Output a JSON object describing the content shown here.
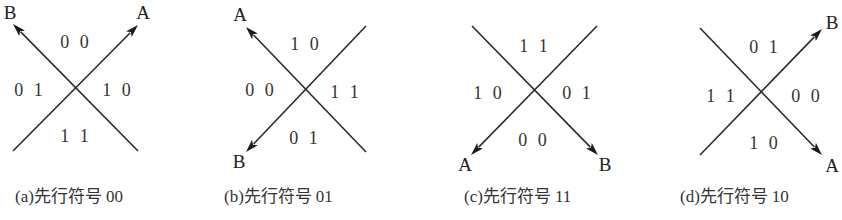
{
  "figure": {
    "panels": [
      {
        "id": "a",
        "caption": {
          "letter": "a",
          "text": "先行符号",
          "code": "00",
          "x": 15
        },
        "center": [
          75,
          88
        ],
        "lines": [
          {
            "from": [
              13,
              151
            ],
            "to": [
              138,
              25
            ],
            "arrow": "to",
            "endpoint_label": "A",
            "label_pos": [
              143,
              12
            ]
          },
          {
            "from": [
              138,
              151
            ],
            "to": [
              13,
              24
            ],
            "arrow": "to",
            "endpoint_label": "B",
            "label_pos": [
              10,
              12
            ]
          }
        ],
        "regions": {
          "top": "00",
          "left": "01",
          "right": "10",
          "bottom": "11"
        },
        "region_pos": {
          "top": [
            76,
            42
          ],
          "left": [
            30,
            90
          ],
          "right": [
            118,
            90
          ],
          "bottom": [
            76,
            136
          ]
        }
      },
      {
        "id": "b",
        "caption": {
          "letter": "b",
          "text": "先行符号",
          "code": "01",
          "x": 224
        },
        "center": [
          305,
          90
        ],
        "lines": [
          {
            "from": [
              366,
              152
            ],
            "to": [
              246,
              27
            ],
            "arrow": "to",
            "endpoint_label": "A",
            "label_pos": [
              240,
              14
            ]
          },
          {
            "from": [
              366,
              26
            ],
            "to": [
              246,
              152
            ],
            "arrow": "to",
            "endpoint_label": "B",
            "label_pos": [
              239,
              161
            ]
          }
        ],
        "regions": {
          "top": "10",
          "left": "00",
          "right": "11",
          "bottom": "01"
        },
        "region_pos": {
          "top": [
            306,
            44
          ],
          "left": [
            261,
            90
          ],
          "right": [
            346,
            92
          ],
          "bottom": [
            305,
            138
          ]
        }
      },
      {
        "id": "c",
        "caption": {
          "letter": "c",
          "text": "先行符号",
          "code": "11",
          "x": 464
        },
        "center": [
          535,
          91
        ],
        "lines": [
          {
            "from": [
              597,
              26
            ],
            "to": [
              471,
              155
            ],
            "arrow": "to",
            "endpoint_label": "A",
            "label_pos": [
              465,
              164
            ]
          },
          {
            "from": [
              472,
              26
            ],
            "to": [
              598,
              155
            ],
            "arrow": "to",
            "endpoint_label": "B",
            "label_pos": [
              605,
              164
            ]
          }
        ],
        "regions": {
          "top": "11",
          "left": "10",
          "right": "01",
          "bottom": "00"
        },
        "region_pos": {
          "top": [
            535,
            46
          ],
          "left": [
            489,
            93
          ],
          "right": [
            578,
            93
          ],
          "bottom": [
            534,
            140
          ]
        }
      },
      {
        "id": "d",
        "caption": {
          "letter": "d",
          "text": "先行符号",
          "code": "10",
          "x": 680
        },
        "center": [
          762,
          94
        ],
        "lines": [
          {
            "from": [
              700,
              28
            ],
            "to": [
              822,
              155
            ],
            "arrow": "to",
            "endpoint_label": "A",
            "label_pos": [
              832,
              165
            ]
          },
          {
            "from": [
              700,
              155
            ],
            "to": [
              822,
              29
            ],
            "arrow": "to",
            "endpoint_label": "B",
            "label_pos": [
              832,
              22
            ]
          }
        ],
        "regions": {
          "top": "01",
          "left": "11",
          "right": "00",
          "bottom": "10"
        },
        "region_pos": {
          "top": [
            765,
            47
          ],
          "left": [
            722,
            96
          ],
          "right": [
            807,
            96
          ],
          "bottom": [
            765,
            143
          ]
        }
      }
    ]
  },
  "colors": {
    "line": "#2a2a2a",
    "text": "#222222",
    "background": "#ffffff"
  }
}
